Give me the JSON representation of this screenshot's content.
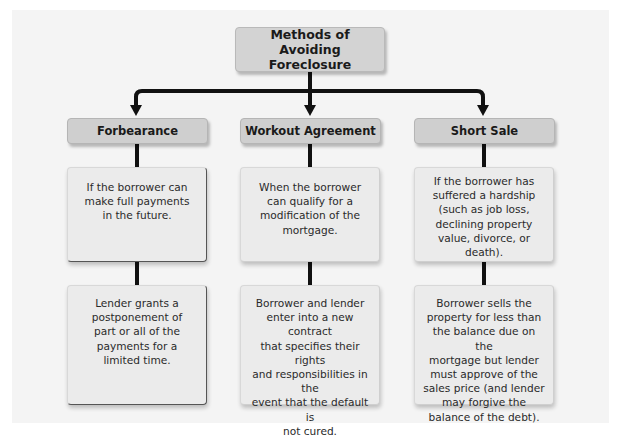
{
  "diagram": {
    "title_line1": "Methods of",
    "title_line2": "Avoiding Foreclosure",
    "columns": [
      {
        "header": "Forbearance",
        "condition": "If the borrower can\nmake full payments\nin the future.",
        "result": "Lender grants a\npostponement of\npart or all of the\npayments for a\nlimited time."
      },
      {
        "header": "Workout Agreement",
        "condition": "When the borrower\ncan qualify for a\nmodification of the\nmortgage.",
        "result": "Borrower and lender\nenter into a new contract\nthat specifies their rights\nand responsibilities in the\nevent that the default is\nnot cured."
      },
      {
        "header": "Short Sale",
        "condition": "If the borrower has\nsuffered a hardship\n(such as job loss,\ndeclining property\nvalue, divorce, or\ndeath).",
        "result": "Borrower sells the\nproperty for less than\nthe balance due on the\nmortgage but lender\nmust approve of the\nsales price (and lender\nmay forgive the\nbalance of the debt)."
      }
    ],
    "colors": {
      "panel_bg": "#f4f4f4",
      "title_bg": "#d3d3d3",
      "header_bg": "#cfcfcf",
      "content_bg": "#ebebeb",
      "connector": "#111111"
    }
  }
}
